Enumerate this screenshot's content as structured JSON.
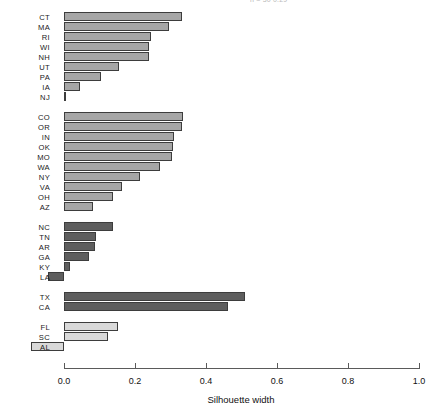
{
  "title_clipped": "n = 30     0.29",
  "chart_data": {
    "type": "bar",
    "title": "",
    "subtitle": "",
    "xlabel": "Silhouette width",
    "ylabel": "",
    "xlim": [
      -0.12,
      1.0
    ],
    "axis_min_label": 0.0,
    "axis_max_label": 1.0,
    "grid": false,
    "legend": "none",
    "orientation": "horizontal",
    "tick_labels": [
      "0.0",
      "0.2",
      "0.4",
      "0.6",
      "0.8",
      "1.0"
    ],
    "tick_values": [
      0.0,
      0.2,
      0.4,
      0.6,
      0.8,
      1.0
    ],
    "clusters": [
      {
        "index": 1,
        "color": "#a6a6a6",
        "categories": [
          "CT",
          "MA",
          "RI",
          "WI",
          "NH",
          "UT",
          "PA",
          "IA",
          "NJ"
        ],
        "values": [
          0.332,
          0.296,
          0.245,
          0.24,
          0.239,
          0.155,
          0.104,
          0.045,
          0.005
        ]
      },
      {
        "index": 2,
        "color": "#a6a6a6",
        "categories": [
          "CO",
          "OR",
          "IN",
          "OK",
          "MO",
          "WA",
          "NY",
          "VA",
          "OH",
          "AZ"
        ],
        "values": [
          0.334,
          0.332,
          0.31,
          0.307,
          0.304,
          0.27,
          0.214,
          0.163,
          0.139,
          0.081
        ]
      },
      {
        "index": 3,
        "color": "#5e5e5e",
        "categories": [
          "NC",
          "TN",
          "AR",
          "GA",
          "KY",
          "LA"
        ],
        "values": [
          0.137,
          0.089,
          0.086,
          0.071,
          0.017,
          -0.044
        ]
      },
      {
        "index": 4,
        "color": "#5e5e5e",
        "categories": [
          "TX",
          "CA"
        ],
        "values": [
          0.51,
          0.462
        ]
      },
      {
        "index": 5,
        "color": "#d9d9d9",
        "categories": [
          "FL",
          "SC",
          "AL"
        ],
        "values": [
          0.151,
          0.123,
          -0.093
        ]
      }
    ]
  }
}
